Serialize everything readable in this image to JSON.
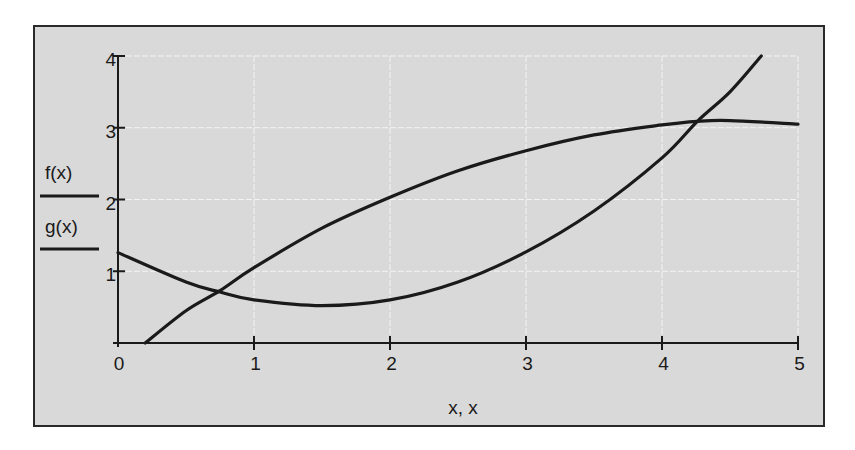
{
  "chart_data": {
    "type": "line",
    "title": "",
    "xlabel": "x, x",
    "ylabel": "",
    "xlim": [
      0,
      5
    ],
    "ylim": [
      0,
      4
    ],
    "x_ticks": [
      "0",
      "1",
      "2",
      "3",
      "4",
      "5"
    ],
    "y_ticks": [
      "1",
      "2",
      "3",
      "4"
    ],
    "grid": true,
    "legend_position": "left",
    "series": [
      {
        "name": "f(x)",
        "x": [
          0.2,
          0.5,
          0.75,
          1.0,
          1.5,
          2.0,
          2.5,
          3.0,
          3.5,
          4.0,
          4.26,
          4.5,
          5.0
        ],
        "y": [
          0.0,
          0.45,
          0.73,
          1.05,
          1.6,
          2.03,
          2.4,
          2.68,
          2.9,
          3.04,
          3.09,
          3.1,
          3.05
        ]
      },
      {
        "name": "g(x)",
        "x": [
          0.0,
          0.5,
          0.75,
          1.0,
          1.5,
          2.0,
          2.5,
          3.0,
          3.5,
          4.0,
          4.26,
          4.5,
          4.73
        ],
        "y": [
          1.26,
          0.85,
          0.71,
          0.6,
          0.52,
          0.6,
          0.85,
          1.27,
          1.84,
          2.58,
          3.09,
          3.5,
          4.0
        ]
      }
    ],
    "annotations": []
  },
  "legend": {
    "items": [
      {
        "label": "f(x)"
      },
      {
        "label": "g(x)"
      }
    ]
  },
  "axes": {
    "x_title": "x, x",
    "x_tick_labels": [
      "0",
      "1",
      "2",
      "3",
      "4",
      "5"
    ],
    "y_tick_labels": [
      "1",
      "2",
      "3",
      "4"
    ]
  },
  "colors": {
    "plot_background": "#d9d9d9",
    "line": "#1a1a1a",
    "grid": "#f4f4f4",
    "frame": "#2a2a2a"
  }
}
